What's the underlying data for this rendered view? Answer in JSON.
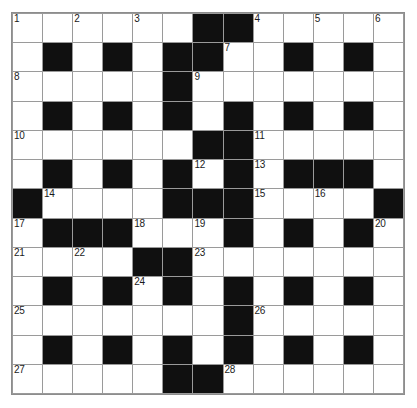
{
  "puzzle": {
    "title": "Crossword Grid",
    "rows": 13,
    "cols": 13,
    "colors": {
      "block": "#101010",
      "cell": "#ffffff",
      "gridline": "#9a9a9a",
      "number": "#1a1a1a",
      "background": "#ffffff"
    },
    "grid": [
      [
        "open",
        "open",
        "open",
        "open",
        "open",
        "open",
        "block",
        "block",
        "open",
        "open",
        "open",
        "open",
        "open"
      ],
      [
        "open",
        "block",
        "open",
        "block",
        "open",
        "block",
        "block",
        "open",
        "open",
        "block",
        "open",
        "block",
        "open"
      ],
      [
        "open",
        "open",
        "open",
        "open",
        "open",
        "block",
        "open",
        "open",
        "open",
        "open",
        "open",
        "open",
        "open"
      ],
      [
        "open",
        "block",
        "open",
        "block",
        "open",
        "block",
        "open",
        "block",
        "open",
        "block",
        "open",
        "block",
        "open"
      ],
      [
        "open",
        "open",
        "open",
        "open",
        "open",
        "open",
        "block",
        "block",
        "open",
        "open",
        "open",
        "open",
        "open"
      ],
      [
        "open",
        "block",
        "open",
        "block",
        "open",
        "block",
        "open",
        "block",
        "open",
        "block",
        "block",
        "block",
        "open"
      ],
      [
        "block",
        "open",
        "open",
        "open",
        "open",
        "block",
        "block",
        "block",
        "open",
        "open",
        "open",
        "open",
        "block"
      ],
      [
        "open",
        "block",
        "block",
        "block",
        "open",
        "open",
        "open",
        "block",
        "open",
        "block",
        "open",
        "block",
        "open"
      ],
      [
        "open",
        "open",
        "open",
        "open",
        "block",
        "block",
        "open",
        "open",
        "open",
        "open",
        "open",
        "open",
        "open"
      ],
      [
        "open",
        "block",
        "open",
        "block",
        "open",
        "block",
        "open",
        "block",
        "open",
        "block",
        "open",
        "block",
        "open"
      ],
      [
        "open",
        "open",
        "open",
        "open",
        "open",
        "open",
        "open",
        "block",
        "open",
        "open",
        "open",
        "open",
        "open"
      ],
      [
        "open",
        "block",
        "open",
        "block",
        "open",
        "block",
        "open",
        "block",
        "open",
        "block",
        "open",
        "block",
        "open"
      ],
      [
        "open",
        "open",
        "open",
        "open",
        "open",
        "block",
        "block",
        "open",
        "open",
        "open",
        "open",
        "open",
        "open"
      ]
    ],
    "numbers": [
      {
        "row": 0,
        "col": 0,
        "label": "1"
      },
      {
        "row": 0,
        "col": 2,
        "label": "2"
      },
      {
        "row": 0,
        "col": 4,
        "label": "3"
      },
      {
        "row": 0,
        "col": 8,
        "label": "4"
      },
      {
        "row": 0,
        "col": 10,
        "label": "5"
      },
      {
        "row": 0,
        "col": 12,
        "label": "6"
      },
      {
        "row": 1,
        "col": 7,
        "label": "7"
      },
      {
        "row": 2,
        "col": 0,
        "label": "8"
      },
      {
        "row": 2,
        "col": 6,
        "label": "9"
      },
      {
        "row": 4,
        "col": 0,
        "label": "10"
      },
      {
        "row": 4,
        "col": 8,
        "label": "11"
      },
      {
        "row": 5,
        "col": 6,
        "label": "12"
      },
      {
        "row": 5,
        "col": 8,
        "label": "13"
      },
      {
        "row": 6,
        "col": 1,
        "label": "14"
      },
      {
        "row": 6,
        "col": 8,
        "label": "15"
      },
      {
        "row": 6,
        "col": 10,
        "label": "16"
      },
      {
        "row": 7,
        "col": 0,
        "label": "17"
      },
      {
        "row": 7,
        "col": 4,
        "label": "18"
      },
      {
        "row": 7,
        "col": 6,
        "label": "19"
      },
      {
        "row": 7,
        "col": 12,
        "label": "20"
      },
      {
        "row": 8,
        "col": 0,
        "label": "21"
      },
      {
        "row": 8,
        "col": 2,
        "label": "22"
      },
      {
        "row": 8,
        "col": 6,
        "label": "23"
      },
      {
        "row": 9,
        "col": 4,
        "label": "24"
      },
      {
        "row": 10,
        "col": 0,
        "label": "25"
      },
      {
        "row": 10,
        "col": 8,
        "label": "26"
      },
      {
        "row": 12,
        "col": 0,
        "label": "27"
      },
      {
        "row": 12,
        "col": 7,
        "label": "28"
      }
    ]
  }
}
